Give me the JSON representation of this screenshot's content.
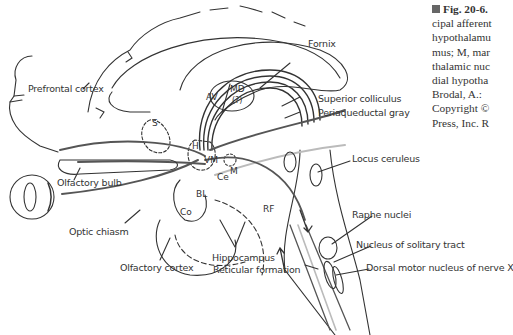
{
  "caption": {
    "lines": [
      "Fig. 20-6.",
      "cipal afferent",
      "hypothalamu",
      "mus; M, mar",
      "thalamic nuc",
      "dial hypotha",
      "Brodal, A.:",
      "Copyright ©",
      "Press, Inc. R"
    ]
  },
  "labels": {
    "prefrontal_cortex": "Prefrontal cortex",
    "fornix": "Fornix",
    "superior_colliculus": "Superior colliculus",
    "periaqueductal_gray": "Periaqueductal gray",
    "olfactory_bulb": "Olfactory bulb",
    "locus_ceruleus": "Locus ceruleus",
    "optic_chiasm": "Optic chiasm",
    "raphe_nuclei": "Raphe nuclei",
    "hippocampus": "Hippocampus",
    "nucleus_solitary_tract": "Nucleus of solitary tract",
    "olfactory_cortex": "Olfactory cortex",
    "reticular_formation": "Reticular formation",
    "dorsal_motor_nucleus": "Dorsal motor nucleus of nerve X"
  },
  "abbreviations": {
    "av": "AV",
    "md": "MD",
    "md_q": "(?)",
    "s": "S",
    "h": "H",
    "vm": "VM",
    "ce": "Ce",
    "m": "M",
    "bl": "BL",
    "co": "Co",
    "rf": "RF"
  },
  "colors": {
    "line": "#333333",
    "tract": "#555555",
    "light_tract": "#bbbbbb"
  }
}
